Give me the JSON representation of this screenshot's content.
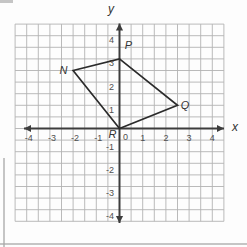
{
  "figure": {
    "background": "#fdfdfd",
    "grid_color": "#b2b2b2",
    "axis_color": "#3d3d3d",
    "shape_color": "#2b2b2b",
    "tick_color": "#4f4f4f",
    "label_color": "#333333"
  },
  "chart_data": {
    "type": "scatter",
    "title": "",
    "subtitle": "",
    "xlabel": "x",
    "ylabel": "y",
    "xlim": [
      -4.5,
      4.5
    ],
    "ylim": [
      -4,
      4.5
    ],
    "grid": "on",
    "grid_step": 0.5,
    "x_ticks": [
      -4,
      -3,
      -2,
      -1,
      0,
      1,
      2,
      3,
      4
    ],
    "y_ticks": [
      4,
      3,
      2,
      1,
      -1,
      -2,
      -3,
      -4
    ],
    "origin_label": "0",
    "polygon": {
      "name": "NPQR",
      "closed": true,
      "vertices": [
        {
          "label": "N",
          "x": -2,
          "y": 2.5
        },
        {
          "label": "P",
          "x": 0,
          "y": 3
        },
        {
          "label": "Q",
          "x": 2.5,
          "y": 1
        },
        {
          "label": "R",
          "x": 0,
          "y": 0
        }
      ]
    }
  }
}
